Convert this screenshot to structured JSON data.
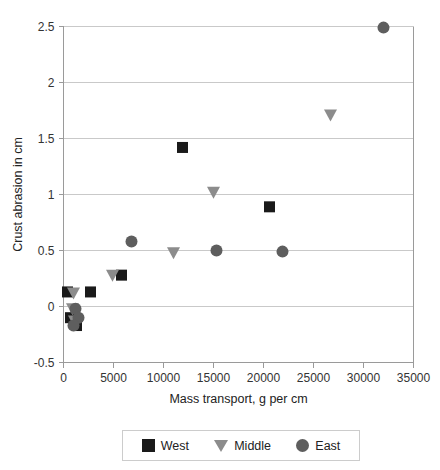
{
  "chart_data": {
    "type": "scatter",
    "title": "",
    "xlabel": "Mass transport, g per cm",
    "ylabel": "Crust abrasion in cm",
    "xlim": [
      0,
      35000
    ],
    "ylim": [
      -0.5,
      2.5
    ],
    "xticks": [
      0,
      5000,
      10000,
      15000,
      20000,
      25000,
      30000,
      35000
    ],
    "xtick_labels": [
      "0",
      "5000",
      "10000",
      "15000",
      "20000",
      "25000",
      "30000",
      "35000"
    ],
    "yticks": [
      -0.5,
      0,
      0.5,
      1,
      1.5,
      2,
      2.5
    ],
    "ytick_labels": [
      "-0.5",
      "0",
      "0.5",
      "1",
      "1.5",
      "2",
      "2.5"
    ],
    "grid": "horizontal",
    "legend_position": "bottom",
    "series": [
      {
        "name": "West",
        "marker": "square",
        "color": "#1a1a1a",
        "points": [
          [
            400,
            0.13
          ],
          [
            2700,
            0.13
          ],
          [
            700,
            -0.1
          ],
          [
            1300,
            -0.17
          ],
          [
            5800,
            0.28
          ],
          [
            11900,
            1.42
          ],
          [
            20600,
            0.89
          ]
        ]
      },
      {
        "name": "Middle",
        "marker": "triangle-down",
        "color": "#8c8c8c",
        "points": [
          [
            1000,
            0.12
          ],
          [
            900,
            -0.02
          ],
          [
            1100,
            -0.13
          ],
          [
            4900,
            0.28
          ],
          [
            11000,
            0.48
          ],
          [
            15000,
            1.02
          ],
          [
            26700,
            1.71
          ]
        ]
      },
      {
        "name": "East",
        "marker": "circle",
        "color": "#5e5e5e",
        "points": [
          [
            1200,
            -0.02
          ],
          [
            1500,
            -0.1
          ],
          [
            1000,
            -0.17
          ],
          [
            6800,
            0.58
          ],
          [
            15300,
            0.5
          ],
          [
            21900,
            0.49
          ],
          [
            32000,
            2.49
          ]
        ]
      }
    ]
  },
  "legend": {
    "entries": [
      {
        "label": "West"
      },
      {
        "label": "Middle"
      },
      {
        "label": "East"
      }
    ]
  }
}
